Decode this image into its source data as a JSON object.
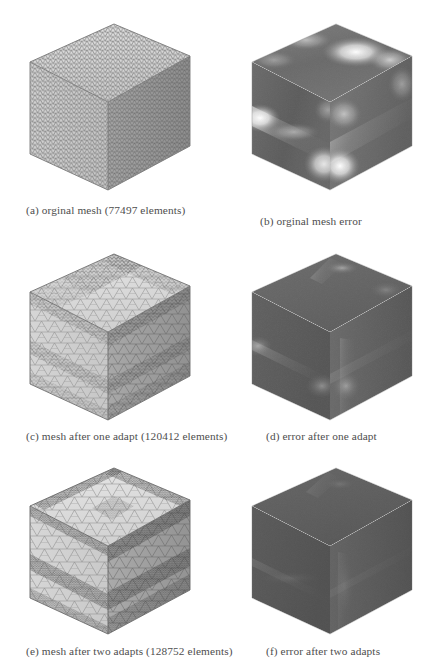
{
  "figure": {
    "background_color": "#ffffff",
    "caption_color": "#4e4e4e",
    "layout": "3 rows x 2 columns of cube renderings with subcaptions",
    "panels": [
      {
        "id": "a",
        "caption": "(a) orginal mesh (77497 elements)",
        "kind": "mesh",
        "element_count": 77497,
        "description": "uniform fine triangular surface mesh on a cube",
        "mesh_density": "uniform",
        "colors": {
          "top": "#d8d8d8",
          "left": "#cfcfcf",
          "right": "#9a9a9a",
          "wire": "#6e6e6e"
        }
      },
      {
        "id": "b",
        "caption": "(b) orginal mesh error",
        "kind": "error",
        "description": "error field on original mesh with bright hotspots along edges and bands",
        "error_level": "high",
        "colors": {
          "base": "#6e6e6e",
          "hot": "#ffffff",
          "dark": "#4c4c4c"
        }
      },
      {
        "id": "c",
        "caption": "(c) mesh after one adapt (120412 elements)",
        "kind": "mesh",
        "element_count": 120412,
        "description": "graded adapted mesh, coarse interior with refined bands",
        "mesh_density": "graded",
        "colors": {
          "top": "#dadada",
          "left": "#d0d0d0",
          "right": "#9d9d9d",
          "wire": "#6a6a6a"
        }
      },
      {
        "id": "d",
        "caption": "(d) error after one adapt",
        "kind": "error",
        "description": "reduced error field, faint light streaks near edges",
        "error_level": "medium",
        "colors": {
          "base": "#5f5f5f",
          "hot": "#c9c9c9",
          "dark": "#4a4a4a"
        }
      },
      {
        "id": "e",
        "caption": "(e) mesh after two adapts (128752 elements)",
        "kind": "mesh",
        "element_count": 128752,
        "description": "strongly graded mesh with dark densely refined bands",
        "mesh_density": "strongly graded",
        "colors": {
          "top": "#dcdcdc",
          "left": "#d2d2d2",
          "right": "#9e9e9e",
          "wire": "#646464"
        }
      },
      {
        "id": "f",
        "caption": "(f) error after two adapts",
        "kind": "error",
        "description": "uniformly dark error field, lowest error",
        "error_level": "low",
        "colors": {
          "base": "#585858",
          "hot": "#a6a6a6",
          "dark": "#474747"
        }
      }
    ]
  }
}
